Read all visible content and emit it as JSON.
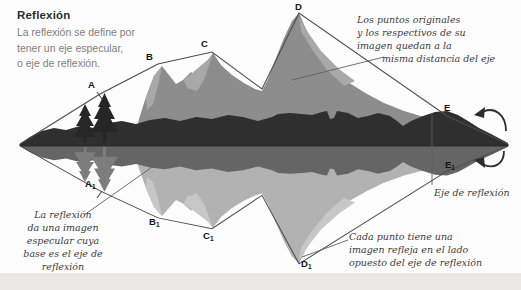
{
  "header": {
    "title": "Reflexión",
    "description_lines": [
      "La reflexión se define por",
      "tener un eje especular,",
      "o eje de reflexión."
    ]
  },
  "annotations": {
    "top_right": {
      "lines": [
        "Los puntos originales",
        "y los respectivos de su",
        "imagen quedan a la",
        "misma distancia del eje"
      ]
    },
    "bottom_left": {
      "lines": [
        "La reflexión",
        "da una imagen",
        "especular cuya",
        "base es el eje de",
        "reflexión"
      ]
    },
    "axis_label": "Eje de reflexión",
    "bottom_right": {
      "lines": [
        "Cada punto tiene una",
        "imagen refleja en el lado",
        "opuesto del eje de reflexión"
      ]
    }
  },
  "points": [
    {
      "label": "A",
      "sub": ""
    },
    {
      "label": "B",
      "sub": ""
    },
    {
      "label": "C",
      "sub": ""
    },
    {
      "label": "D",
      "sub": ""
    },
    {
      "label": "E",
      "sub": ""
    },
    {
      "label": "A",
      "sub": "1"
    },
    {
      "label": "B",
      "sub": "1"
    },
    {
      "label": "C",
      "sub": "1"
    },
    {
      "label": "D",
      "sub": "1"
    },
    {
      "label": "E",
      "sub": "1"
    }
  ],
  "icons": {
    "flip_arrow_top": "curved-flip-arrow",
    "flip_arrow_bottom": "curved-flip-arrow"
  },
  "colors": {
    "mountain": "#8d8d8d",
    "mountain_light": "#a8a8a8",
    "hills_dark": "#2f2f2f",
    "mountain_reflect": "#b2b2b2",
    "mountain_reflect_light": "#c7c7c7",
    "hills_reflect": "#656565",
    "tree": "#262626",
    "tree_reflect": "#7d7d7d",
    "outline": "#4c4c4c",
    "leader": "#5f5f5f",
    "water_line": "#2b2b2b",
    "arrow": "#2c2c2c",
    "footer_strip": "#e9e8e5"
  }
}
